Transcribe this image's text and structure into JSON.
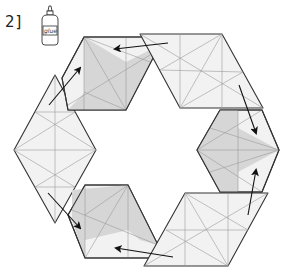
{
  "step": {
    "label": "2]"
  },
  "glue_bottle": {
    "icon": "glue-bottle-icon",
    "text": "glue"
  },
  "diagram": {
    "units": [
      {
        "name": "top-left-unit",
        "shaded": true
      },
      {
        "name": "top-right-unit",
        "shaded": false
      },
      {
        "name": "right-unit",
        "shaded": true
      },
      {
        "name": "bottom-right-unit",
        "shaded": false
      },
      {
        "name": "bottom-left-unit",
        "shaded": true
      },
      {
        "name": "left-unit",
        "shaded": false
      }
    ],
    "arrow_count": 6,
    "colors": {
      "outline": "#333333",
      "paper": "#f2f2f2",
      "shade": "#d6d6d6",
      "crease": "#9a9a9a"
    }
  }
}
